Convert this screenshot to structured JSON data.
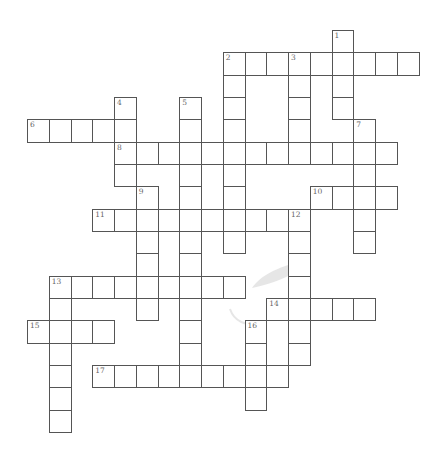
{
  "puzzle": {
    "type": "crossword",
    "origin": {
      "x": 27,
      "y": 30
    },
    "cell_width": 21.75,
    "cell_height": 22.33,
    "border_color": "#555555",
    "number_color": "#666666",
    "entries": [
      {
        "number": 1,
        "direction": "down",
        "row": 0,
        "col": 14,
        "length": 4
      },
      {
        "number": 2,
        "direction": "across",
        "row": 1,
        "col": 9,
        "length": 9
      },
      {
        "number": 2,
        "direction": "down",
        "row": 1,
        "col": 9,
        "length": 9
      },
      {
        "number": 3,
        "direction": "down",
        "row": 1,
        "col": 12,
        "length": 5
      },
      {
        "number": 4,
        "direction": "down",
        "row": 3,
        "col": 4,
        "length": 4
      },
      {
        "number": 5,
        "direction": "down",
        "row": 3,
        "col": 7,
        "length": 13
      },
      {
        "number": 6,
        "direction": "across",
        "row": 4,
        "col": 0,
        "length": 5
      },
      {
        "number": 7,
        "direction": "down",
        "row": 4,
        "col": 15,
        "length": 6
      },
      {
        "number": 8,
        "direction": "across",
        "row": 5,
        "col": 4,
        "length": 13
      },
      {
        "number": 9,
        "direction": "down",
        "row": 7,
        "col": 5,
        "length": 6
      },
      {
        "number": 10,
        "direction": "across",
        "row": 7,
        "col": 13,
        "length": 4
      },
      {
        "number": 11,
        "direction": "across",
        "row": 8,
        "col": 3,
        "length": 10
      },
      {
        "number": 12,
        "direction": "down",
        "row": 8,
        "col": 12,
        "length": 7
      },
      {
        "number": 13,
        "direction": "across",
        "row": 11,
        "col": 1,
        "length": 9
      },
      {
        "number": 13,
        "direction": "down",
        "row": 11,
        "col": 1,
        "length": 7
      },
      {
        "number": 14,
        "direction": "across",
        "row": 12,
        "col": 11,
        "length": 5
      },
      {
        "number": 15,
        "direction": "across",
        "row": 13,
        "col": 0,
        "length": 4
      },
      {
        "number": 16,
        "direction": "down",
        "row": 13,
        "col": 10,
        "length": 4
      },
      {
        "number": 17,
        "direction": "across",
        "row": 15,
        "col": 3,
        "length": 9
      }
    ]
  }
}
